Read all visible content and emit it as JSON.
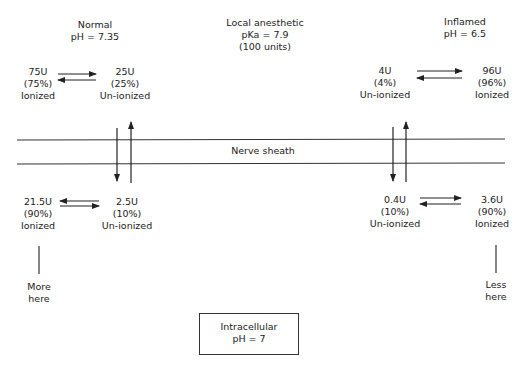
{
  "title_normal": {
    "line1": "Normal",
    "line2": "pH = 7.35"
  },
  "title_drug": {
    "line1": "Local anesthetic",
    "line2": "pKa = 7.9",
    "line3": "(100 units)"
  },
  "title_inflamed": {
    "line1": "Inflamed",
    "line2": "pH = 6.5"
  },
  "normal_top": {
    "ionized": {
      "amount": "75U",
      "percent": "(75%)",
      "label": "Ionized"
    },
    "unionized": {
      "amount": "25U",
      "percent": "(25%)",
      "label": "Un-ionized"
    }
  },
  "inflamed_top": {
    "unionized": {
      "amount": "4U",
      "percent": "(4%)",
      "label": "Un-ionized"
    },
    "ionized": {
      "amount": "96U",
      "percent": "(96%)",
      "label": "Ionized"
    }
  },
  "membrane": {
    "label": "Nerve sheath"
  },
  "normal_bottom": {
    "ionized": {
      "amount": "21.5U",
      "percent": "(90%)",
      "label": "Ionized"
    },
    "unionized": {
      "amount": "2.5U",
      "percent": "(10%)",
      "label": "Un-ionized"
    },
    "note": {
      "line1": "More",
      "line2": "here"
    }
  },
  "inflamed_bottom": {
    "unionized": {
      "amount": "0.4U",
      "percent": "(10%)",
      "label": "Un-ionized"
    },
    "ionized": {
      "amount": "3.6U",
      "percent": "(90%)",
      "label": "Ionized"
    },
    "note": {
      "line1": "Less",
      "line2": "here"
    }
  },
  "intracellular": {
    "line1": "Intracellular",
    "line2": "pH = 7"
  }
}
